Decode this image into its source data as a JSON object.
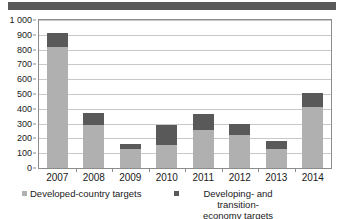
{
  "banner": {
    "color": "#595959"
  },
  "chart_data": {
    "type": "bar",
    "subtype": "stacked-vertical",
    "title": "",
    "subtitle": "",
    "xlabel": "",
    "ylabel": "",
    "categories": [
      "2007",
      "2008",
      "2009",
      "2010",
      "2011",
      "2012",
      "2013",
      "2014"
    ],
    "series": [
      {
        "name": "Developed-country targets",
        "color": "#b0b0b0",
        "values": [
          820,
          290,
          130,
          153,
          257,
          225,
          130,
          415
        ]
      },
      {
        "name": "Developing- and transition-economy targets",
        "color": "#595959",
        "values": [
          90,
          85,
          32,
          137,
          106,
          75,
          55,
          90
        ]
      }
    ],
    "totals": [
      910,
      375,
      162,
      290,
      363,
      300,
      185,
      505
    ],
    "ylim": [
      0,
      1000
    ],
    "ytick_step": 100,
    "ytick_labels": [
      "1 000",
      "900",
      "800",
      "700",
      "600",
      "500",
      "400",
      "300",
      "200",
      "100",
      "0"
    ],
    "ytick_values": [
      1000,
      900,
      800,
      700,
      600,
      500,
      400,
      300,
      200,
      100,
      0
    ],
    "grid": "horizontal",
    "grid_color": "#c8c8c8",
    "frame_color": "#8c8c8c",
    "legend_position": "bottom",
    "legend": [
      {
        "label": "Developed-country targets",
        "color": "#b0b0b0"
      },
      {
        "label": "Developing- and transition-\neconomy targets",
        "color": "#595959"
      }
    ]
  }
}
